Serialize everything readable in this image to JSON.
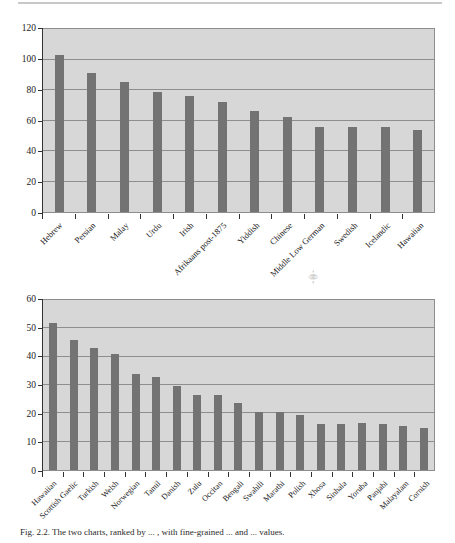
{
  "page": {
    "caption": "Fig. 2.2. The two charts, ranked by ... , with fine-grained ... and ... values.",
    "speck_glyph": "⸎"
  },
  "chart_data": [
    {
      "id": "top",
      "type": "bar",
      "title": "",
      "xlabel": "",
      "ylabel": "",
      "ylim": [
        0,
        120
      ],
      "yticks": [
        0,
        20,
        40,
        60,
        80,
        100,
        120
      ],
      "grid": true,
      "legend": "none",
      "categories": [
        "Hebrew",
        "Persian",
        "Malay",
        "Urdu",
        "Irish",
        "Afrikaans post-1875",
        "Yiddish",
        "Chinese",
        "Middle Low German",
        "Swedish",
        "Icelandic",
        "Hawaiian"
      ],
      "values": [
        103,
        91,
        85,
        79,
        76,
        72,
        66,
        62,
        56,
        56,
        56,
        54
      ]
    },
    {
      "id": "bottom",
      "type": "bar",
      "title": "",
      "xlabel": "",
      "ylabel": "",
      "ylim": [
        0,
        60
      ],
      "yticks": [
        0,
        10,
        20,
        30,
        40,
        50,
        60
      ],
      "grid": true,
      "legend": "none",
      "categories": [
        "Hawaiian",
        "Scottish Gaelic",
        "Turkish",
        "Welsh",
        "Norwegian",
        "Tamil",
        "Danish",
        "Zulu",
        "Occitan",
        "Bengali",
        "Swahili",
        "Marathi",
        "Polish",
        "Xhosa",
        "Sinhala",
        "Yoruba",
        "Panjabi",
        "Malayalam",
        "Cornish"
      ],
      "values": [
        52,
        46,
        43,
        41,
        34,
        33,
        29.5,
        26.5,
        26.5,
        23.5,
        20.5,
        20.5,
        19.5,
        16.3,
        16.3,
        16.5,
        16.3,
        15.5,
        14.7
      ]
    }
  ],
  "colors": {
    "bar": "#737373",
    "plot_background": "#d7d7d7",
    "gridline": "#8e8e8e",
    "axis": "#333333",
    "page_background": "#ffffff"
  }
}
